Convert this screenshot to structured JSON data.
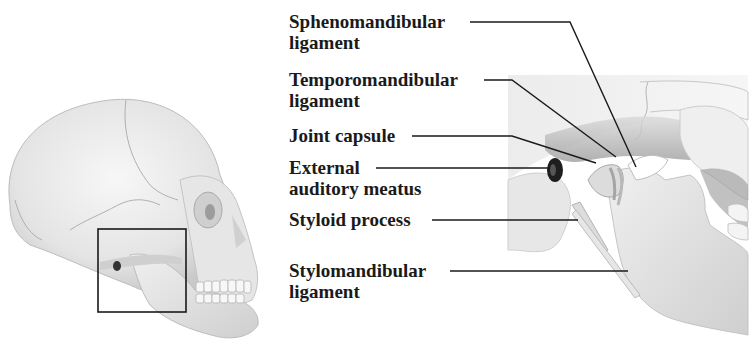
{
  "figure": {
    "overview": {
      "subject": "Lateral view of skull",
      "highlight_box": "Temporomandibular joint region"
    },
    "detail": {
      "subject": "Enlarged temporomandibular joint, lateral view"
    },
    "labels": [
      {
        "line1": "Sphenomandibular",
        "line2": "ligament"
      },
      {
        "line1": "Temporomandibular",
        "line2": "ligament"
      },
      {
        "line1": "Joint capsule",
        "line2": ""
      },
      {
        "line1": "External",
        "line2": "auditory meatus"
      },
      {
        "line1": "Styloid process",
        "line2": ""
      },
      {
        "line1": "Stylomandibular",
        "line2": "ligament"
      }
    ],
    "colors": {
      "bone": "#e9e9e9",
      "bone_shadow": "#bdbdbd",
      "leader_line": "#1a1a1a",
      "text": "#1a1a1a"
    }
  }
}
